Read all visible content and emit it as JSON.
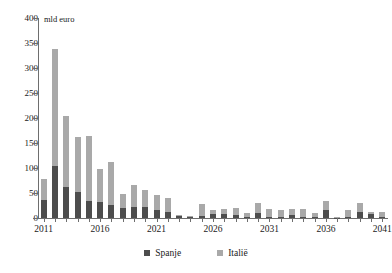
{
  "chart_data": {
    "type": "bar",
    "stacked": true,
    "title": "",
    "subtitle": "",
    "xlabel": "",
    "ylabel": "",
    "unit_label": "mld euro",
    "ylim": [
      0,
      400
    ],
    "ytick_step": 50,
    "yticks": [
      400,
      350,
      300,
      250,
      200,
      150,
      100,
      50,
      0
    ],
    "grid": false,
    "legend_position": "bottom-center",
    "categories": [
      "2011",
      "2012",
      "2013",
      "2014",
      "2015",
      "2016",
      "2017",
      "2018",
      "2019",
      "2020",
      "2021",
      "2022",
      "2023",
      "2024",
      "2025",
      "2026",
      "2027",
      "2028",
      "2029",
      "2030",
      "2031",
      "2032",
      "2033",
      "2034",
      "2035",
      "2036",
      "2037",
      "2038",
      "2039",
      "2040",
      "2041"
    ],
    "xtick_labels": [
      "2011",
      "2016",
      "2021",
      "2026",
      "2031",
      "2036",
      "2041"
    ],
    "series": [
      {
        "name": "Spanje",
        "color": "#4d4d4d",
        "values": [
          37,
          104,
          62,
          53,
          34,
          33,
          27,
          20,
          22,
          23,
          16,
          13,
          4,
          2,
          4,
          8,
          9,
          6,
          2,
          11,
          2,
          2,
          7,
          2,
          2,
          17,
          1,
          2,
          13,
          9,
          2
        ]
      },
      {
        "name": "Italië",
        "color": "#a9a9a9",
        "values": [
          42,
          235,
          143,
          110,
          131,
          65,
          85,
          28,
          45,
          33,
          30,
          28,
          3,
          2,
          25,
          9,
          10,
          15,
          8,
          20,
          17,
          14,
          11,
          16,
          9,
          17,
          1,
          14,
          18,
          4,
          10
        ]
      }
    ]
  },
  "legend": {
    "items": [
      {
        "label": "Spanje",
        "color": "#4d4d4d"
      },
      {
        "label": "Italië",
        "color": "#a9a9a9"
      }
    ]
  }
}
